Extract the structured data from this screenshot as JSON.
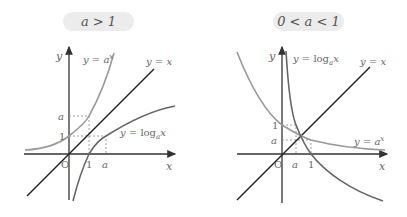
{
  "left_panel": {
    "condition_label": "a > 1",
    "axis_labels": {
      "x": "x",
      "y": "y",
      "origin": "O"
    },
    "curve_labels": {
      "exp": "y = a^x",
      "log": "y = log_a x",
      "identity": "y = x"
    },
    "tick_labels": {
      "y_one": "1",
      "y_a": "a",
      "x_one": "1",
      "x_a": "a"
    }
  },
  "right_panel": {
    "condition_label": "0 < a < 1",
    "axis_labels": {
      "x": "x",
      "y": "y",
      "origin": "O"
    },
    "curve_labels": {
      "exp": "y = a^x",
      "log": "y = log_a x",
      "identity": "y = x"
    },
    "tick_labels": {
      "y_one": "1",
      "y_a": "a",
      "x_one": "1",
      "x_a": "a"
    }
  },
  "colors": {
    "axis": "#333333",
    "identity_line": "#222222",
    "exp_curve": "#999999",
    "log_curve": "#666666",
    "dashed": "#888888",
    "pill_bg": "#ececec"
  }
}
